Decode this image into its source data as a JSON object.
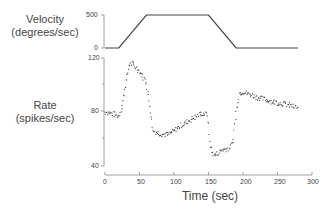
{
  "chart_data": [
    {
      "type": "line",
      "panel": "top",
      "ylabel": "Velocity (degrees/sec)",
      "ylabel_lines": [
        "Velocity",
        "(degrees/sec)"
      ],
      "yticks": [
        0,
        500
      ],
      "ylim": [
        0,
        500
      ],
      "x": [
        0,
        20,
        60,
        150,
        190,
        280
      ],
      "values": [
        0,
        0,
        500,
        500,
        0,
        0
      ]
    },
    {
      "type": "scatter",
      "panel": "bottom",
      "ylabel": "Rate (spikes/sec)",
      "ylabel_lines": [
        "Rate",
        "(spikes/sec)"
      ],
      "xlabel": "Time (sec)",
      "xticks": [
        0,
        50,
        100,
        150,
        200,
        250,
        300
      ],
      "xlim": [
        0,
        300
      ],
      "yticks": [
        40,
        80,
        120
      ],
      "ylim": [
        40,
        120
      ],
      "x": [
        0,
        10,
        20,
        25,
        30,
        35,
        40,
        50,
        60,
        62,
        65,
        70,
        80,
        90,
        100,
        110,
        120,
        140,
        148,
        150,
        152,
        155,
        160,
        170,
        180,
        185,
        190,
        195,
        200,
        210,
        220,
        240,
        260,
        280
      ],
      "values": [
        80,
        79,
        77,
        85,
        100,
        115,
        116,
        110,
        102,
        95,
        85,
        66,
        64,
        63,
        66,
        70,
        73,
        79,
        78,
        70,
        58,
        50,
        48,
        52,
        53,
        57,
        80,
        94,
        95,
        93,
        91,
        88,
        86,
        83
      ]
    }
  ],
  "labels": {
    "velocity_line1": "Velocity",
    "velocity_line2": "(degrees/sec)",
    "rate_line1": "Rate",
    "rate_line2": "(spikes/sec)",
    "xlabel": "Time (sec)"
  },
  "ticks": {
    "vel": [
      "500",
      "0"
    ],
    "rate": [
      "120",
      "80",
      "40"
    ],
    "time": [
      "0",
      "50",
      "100",
      "150",
      "200",
      "250",
      "300"
    ]
  }
}
